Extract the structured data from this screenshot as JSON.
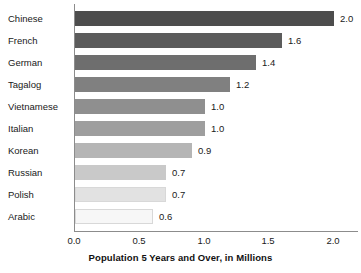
{
  "chart_data": {
    "type": "bar",
    "orientation": "horizontal",
    "title": "",
    "xlabel": "Population 5 Years and Over, in Millions",
    "ylabel": "",
    "xlim": [
      0.0,
      2.0
    ],
    "xticks": [
      "0.0",
      "0.5",
      "1.0",
      "1.5",
      "2.0"
    ],
    "xtick_values": [
      0.0,
      0.5,
      1.0,
      1.5,
      2.0
    ],
    "grid": false,
    "legend": null,
    "categories": [
      "Chinese",
      "French",
      "German",
      "Tagalog",
      "Vietnamese",
      "Italian",
      "Korean",
      "Russian",
      "Polish",
      "Arabic"
    ],
    "values": [
      2.0,
      1.6,
      1.4,
      1.2,
      1.0,
      1.0,
      0.9,
      0.7,
      0.7,
      0.6
    ],
    "value_labels": [
      "2.0",
      "1.6",
      "1.4",
      "1.2",
      "1.0",
      "1.0",
      "0.9",
      "0.7",
      "0.7",
      "0.6"
    ],
    "bar_colors": [
      "#4d4d4d",
      "#5c5c5c",
      "#6e6e6e",
      "#808080",
      "#8f8f8f",
      "#9e9e9e",
      "#b5b5b5",
      "#c9c9c9",
      "#e2e2e2",
      "#f7f7f7"
    ],
    "axis_color": "#8c8c8c",
    "text_color": "#1a1a1a"
  }
}
